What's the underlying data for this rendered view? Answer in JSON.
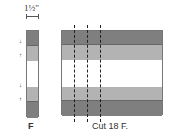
{
  "dimension": {
    "label": "1½\""
  },
  "strip": {
    "label": "F",
    "bands": [
      {
        "name": "dark",
        "color": "#7f7f7f",
        "top": 0,
        "height": 15
      },
      {
        "name": "medium",
        "color": "#b3b3b3",
        "top": 15,
        "height": 15
      },
      {
        "name": "white",
        "color": "#ffffff",
        "top": 30,
        "height": 26
      },
      {
        "name": "medium",
        "color": "#b3b3b3",
        "top": 56,
        "height": 15
      },
      {
        "name": "dark",
        "color": "#7f7f7f",
        "top": 71,
        "height": 16
      }
    ],
    "arrows": [
      "↓",
      "↑",
      "↓",
      "↑"
    ]
  },
  "block": {
    "caption": "Cut 18 F.",
    "bands": [
      {
        "name": "dark",
        "color": "#7f7f7f",
        "top": 0,
        "height": 14
      },
      {
        "name": "medium",
        "color": "#b3b3b3",
        "top": 14,
        "height": 15
      },
      {
        "name": "white",
        "color": "#ffffff",
        "top": 29,
        "height": 27
      },
      {
        "name": "medium",
        "color": "#b3b3b3",
        "top": 56,
        "height": 14
      },
      {
        "name": "dark",
        "color": "#7f7f7f",
        "top": 70,
        "height": 15
      }
    ],
    "cut_lines_x": [
      12,
      25,
      38
    ]
  }
}
